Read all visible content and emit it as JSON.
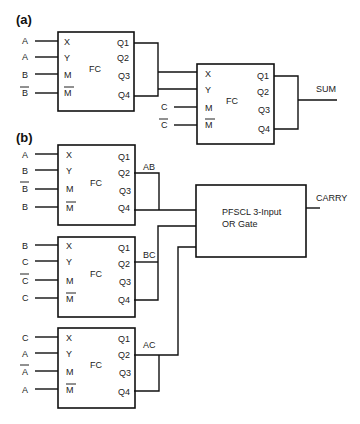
{
  "parts": {
    "a": "(a)",
    "b": "(b)"
  },
  "block_label": "FC",
  "pins": {
    "x": "X",
    "y": "Y",
    "m": "M",
    "mbar": "M",
    "q1": "Q1",
    "q2": "Q2",
    "q3": "Q3",
    "q4": "Q4"
  },
  "part_a": {
    "fc1_inputs": [
      {
        "label": "A",
        "bar": false
      },
      {
        "label": "A",
        "bar": false
      },
      {
        "label": "B",
        "bar": false
      },
      {
        "label": "B",
        "bar": true
      }
    ],
    "fc2_inputs": [
      {
        "label": "C",
        "bar": false
      },
      {
        "label": "C",
        "bar": true
      }
    ],
    "output": "SUM"
  },
  "part_b": {
    "blocks": [
      {
        "inputs": [
          {
            "label": "A",
            "bar": false
          },
          {
            "label": "B",
            "bar": false
          },
          {
            "label": "B",
            "bar": true
          },
          {
            "label": "B",
            "bar": false
          }
        ],
        "output": "AB"
      },
      {
        "inputs": [
          {
            "label": "B",
            "bar": false
          },
          {
            "label": "C",
            "bar": false
          },
          {
            "label": "C",
            "bar": true
          },
          {
            "label": "C",
            "bar": false
          }
        ],
        "output": "BC"
      },
      {
        "inputs": [
          {
            "label": "C",
            "bar": false
          },
          {
            "label": "A",
            "bar": false
          },
          {
            "label": "A",
            "bar": true
          },
          {
            "label": "A",
            "bar": false
          }
        ],
        "output": "AC"
      }
    ],
    "or_gate": {
      "line1": "PFSCL 3-Input",
      "line2": "OR Gate"
    },
    "output": "CARRY"
  }
}
